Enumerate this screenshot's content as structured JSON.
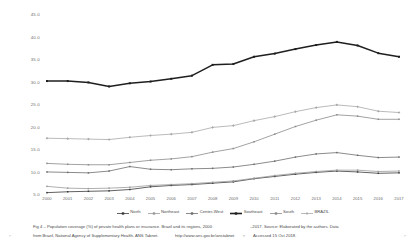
{
  "figure": {
    "label": "Fig 4",
    "caption_line1": "Fig 4 –  Population coverage (%) of private health plans or insurance. Brazil and its regions, 2000",
    "caption_line1_right": "–2017.    Source: Elaborated by the authors. Data",
    "caption_line2": "from Brazil, National Agency of Supplementary Health, ANS Tabnet.",
    "caption_line2_url": "http://www.ans.gov.br/anstabnet",
    "caption_line3": "Accessed 15 Oct 2018.",
    "marker_left": "⌐",
    "marker_mid": "≡",
    "marker_right": "⌐"
  },
  "chart_data": {
    "type": "line",
    "xlabel": "",
    "ylabel": "",
    "grid": false,
    "legend_position": "bottom",
    "ylim": [
      5.0,
      45.0
    ],
    "yticks": [
      "45.0",
      "40.0",
      "35.0",
      "30.0",
      "25.0",
      "20.0",
      "15.0",
      "10.0",
      "5.0"
    ],
    "ytick_values": [
      45.0,
      40.0,
      35.0,
      30.0,
      25.0,
      20.0,
      15.0,
      10.0,
      5.0
    ],
    "categories": [
      "2000",
      "2001",
      "2002",
      "2003",
      "2004",
      "2005",
      "2006",
      "2007",
      "2008",
      "2009",
      "2010",
      "2011",
      "2012",
      "2013",
      "2014",
      "2015",
      "2016",
      "2017"
    ],
    "series": [
      {
        "name": "North",
        "color": "#3a3a3a",
        "marker": "square",
        "values": [
          5.3,
          5.5,
          5.6,
          5.7,
          6.0,
          6.6,
          6.9,
          7.1,
          7.4,
          7.7,
          8.4,
          8.9,
          9.4,
          9.8,
          10.1,
          9.9,
          9.6,
          9.7
        ]
      },
      {
        "name": "Northeast",
        "color": "#9b9b9b",
        "marker": "square",
        "values": [
          6.7,
          6.3,
          6.2,
          6.3,
          6.5,
          6.9,
          7.1,
          7.3,
          7.6,
          7.9,
          8.5,
          9.1,
          9.6,
          10.0,
          10.3,
          10.3,
          10.0,
          10.1
        ]
      },
      {
        "name": "Center-West",
        "color": "#6d6d6d",
        "marker": "square",
        "values": [
          9.9,
          9.8,
          9.7,
          10.1,
          11.1,
          10.5,
          10.4,
          10.6,
          10.7,
          11.0,
          11.6,
          12.3,
          13.2,
          13.9,
          14.2,
          13.6,
          13.1,
          13.2
        ]
      },
      {
        "name": "Southeast",
        "color": "#1f1f1f",
        "marker": "square",
        "values": [
          30.1,
          30.1,
          29.8,
          28.9,
          29.6,
          30.0,
          30.6,
          31.3,
          33.7,
          33.9,
          35.5,
          36.2,
          37.2,
          38.1,
          38.8,
          38.0,
          36.3,
          35.5
        ]
      },
      {
        "name": "South",
        "color": "#8a8a8a",
        "marker": "square",
        "values": [
          11.8,
          11.6,
          11.5,
          11.5,
          12.0,
          12.5,
          12.8,
          13.3,
          14.3,
          15.1,
          16.6,
          18.3,
          20.0,
          21.4,
          22.6,
          22.3,
          21.6,
          21.6
        ]
      },
      {
        "name": "BRAZIL",
        "color": "#a8a8a8",
        "marker": "diamond",
        "values": [
          17.4,
          17.3,
          17.2,
          17.1,
          17.6,
          18.0,
          18.3,
          18.7,
          19.8,
          20.2,
          21.3,
          22.2,
          23.3,
          24.2,
          24.8,
          24.4,
          23.4,
          23.1
        ]
      }
    ]
  }
}
